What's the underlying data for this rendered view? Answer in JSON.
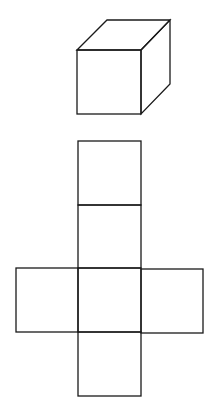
{
  "figure": {
    "background": "#ffffff",
    "stroke": "#1a1a1a",
    "cube": {
      "front": {
        "x": 77,
        "y": 50,
        "w": 64,
        "h": 64
      },
      "depth": {
        "dx": 30,
        "dy": -30
      }
    },
    "net": {
      "column": {
        "x": 78,
        "w": 63,
        "rows_y": [
          141,
          205,
          268,
          332,
          396
        ]
      },
      "arms": {
        "left_x": 16,
        "right_x": 203,
        "top_y": 268,
        "bottom_y": 332
      }
    }
  }
}
